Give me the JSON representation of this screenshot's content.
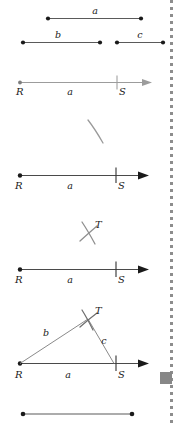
{
  "figure": {
    "background_color": "#ffffff",
    "ink_color": "#1a1a1a",
    "light_ink_color": "#8a8a8a",
    "arc_color": "#9a9a9a",
    "swatch_color": "#878787",
    "dotted_rule_color": "#8d8d8d"
  },
  "steps": [
    {
      "id": "given-segments",
      "name": "Given segments",
      "labels": {
        "a": "a",
        "b": "b",
        "c": "c"
      }
    },
    {
      "id": "ray-faded",
      "name": "Copy segment a onto a ray",
      "labels": {
        "R": "R",
        "S": "S",
        "a": "a"
      }
    },
    {
      "id": "arc-b",
      "name": "Arc of radius b from R",
      "labels": {}
    },
    {
      "id": "ray-solid",
      "name": "Base segment RS of length a",
      "labels": {
        "R": "R",
        "S": "S",
        "a": "a"
      }
    },
    {
      "id": "arcs-cross",
      "name": "Arcs of radius b and c intersect at T",
      "labels": {
        "T": "T"
      }
    },
    {
      "id": "ray-solid-2",
      "name": "Base segment RS with arc intersection T above",
      "labels": {
        "R": "R",
        "S": "S",
        "a": "a"
      }
    },
    {
      "id": "triangle-rst",
      "name": "Completed triangle RST",
      "labels": {
        "R": "R",
        "S": "S",
        "T": "T",
        "a": "a",
        "b": "b",
        "c": "c"
      }
    },
    {
      "id": "bottom-segment",
      "name": "Plain segment at foot of figure",
      "labels": {}
    }
  ],
  "swatch": {
    "name": "gray-square-marker",
    "color": "#878787"
  }
}
